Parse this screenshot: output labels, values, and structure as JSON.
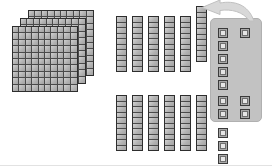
{
  "canvas": {
    "width": 272,
    "height": 166,
    "background": "#ffffff"
  },
  "title": "Base-ten blocks regrouping workspace",
  "colors": {
    "block_fill": "#b8b8b8",
    "block_outline": "#2e2e2e",
    "grid_line": "#4a4a4a",
    "panel_fill": "#c2c2c2",
    "panel_border": "#b0b0b0",
    "cube_face": "#e6e6e6",
    "arrow_fill": "#d6d6d6",
    "arrow_outline": "#bdbdbd",
    "page_border": "#e2e2e2"
  },
  "flats": {
    "label": "hundred-flat",
    "count": 3,
    "rows": 10,
    "cols": 10,
    "value_each": 100,
    "total_value": 300,
    "size": 66,
    "offset_step": 8,
    "base_left": 12,
    "base_top": 26
  },
  "rod_rows": [
    {
      "label": "ten-rod-row-top",
      "count": 6,
      "segments": 10,
      "value_each": 10,
      "total_value": 60,
      "left": 116,
      "top": 16,
      "step": 16,
      "width": 11,
      "height": 56,
      "raised_index": 5,
      "raise_amount": 10
    },
    {
      "label": "ten-rod-row-bottom",
      "count": 6,
      "segments": 10,
      "value_each": 10,
      "total_value": 60,
      "left": 116,
      "top": 95,
      "step": 16,
      "width": 11,
      "height": 56,
      "raised_index": -1,
      "raise_amount": 0
    }
  ],
  "panel": {
    "label": "regrouping-panel",
    "left": 210,
    "top": 18,
    "width": 52,
    "height": 104,
    "radius": 5
  },
  "cubes": {
    "label": "unit-cube",
    "value_each": 1,
    "size": 10,
    "groups": [
      {
        "name": "panel-left-column",
        "count": 5,
        "left": 218,
        "top": 28,
        "dx": 0,
        "dy": 13,
        "inside_panel": true
      },
      {
        "name": "panel-top-right-single",
        "count": 1,
        "left": 240,
        "top": 28,
        "dx": 0,
        "dy": 0,
        "inside_panel": true
      },
      {
        "name": "panel-bottom-quad",
        "count": 4,
        "left": 218,
        "top": 96,
        "dx": 22,
        "dy": 13,
        "cols": 2,
        "inside_panel": true
      },
      {
        "name": "loose-below-panel",
        "count": 3,
        "left": 218,
        "top": 128,
        "dx": 0,
        "dy": 13,
        "inside_panel": false
      }
    ],
    "total_count": 13
  },
  "arrow": {
    "name": "regroup-arrow",
    "direction": "curved-left",
    "left": 198,
    "top": 0,
    "width": 58,
    "height": 22
  },
  "totals": {
    "hundreds": 3,
    "tens": 12,
    "ones": 13,
    "note": "3 hundreds, 12 tens, 13 ones"
  }
}
